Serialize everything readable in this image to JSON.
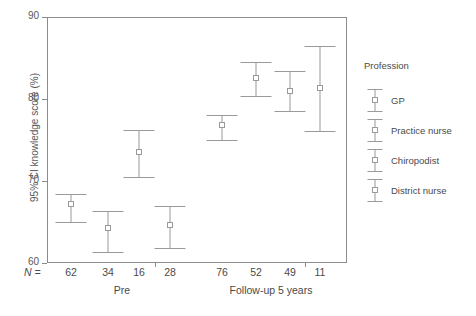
{
  "chart_data": {
    "type": "scatter",
    "title": "",
    "xlabel": "",
    "ylabel": "95% CI knowledge score (%)",
    "ylim": [
      60,
      90
    ],
    "yticks": [
      60,
      70,
      80,
      90
    ],
    "grid": false,
    "legend_position": "right",
    "legend_title": "Profession",
    "n_row_label": "N =",
    "groups": [
      "Pre",
      "Follow-up 5 years"
    ],
    "series": [
      "GP",
      "Practice nurse",
      "Chiropodist",
      "District nurse"
    ],
    "points": [
      {
        "group": "Pre",
        "series": "GP",
        "n": "62",
        "mean": 67.2,
        "lower": 65.0,
        "upper": 68.4
      },
      {
        "group": "Pre",
        "series": "Practice nurse",
        "n": "34",
        "mean": 64.3,
        "lower": 61.4,
        "upper": 66.3
      },
      {
        "group": "Pre",
        "series": "Chiropodist",
        "n": "16",
        "mean": 73.5,
        "lower": 70.5,
        "upper": 76.2
      },
      {
        "group": "Pre",
        "series": "District nurse",
        "n": "28",
        "mean": 64.6,
        "lower": 61.8,
        "upper": 66.9
      },
      {
        "group": "Follow-up 5 years",
        "series": "GP",
        "n": "76",
        "mean": 76.8,
        "lower": 75.0,
        "upper": 78.0
      },
      {
        "group": "Follow-up 5 years",
        "series": "Practice nurse",
        "n": "52",
        "mean": 82.6,
        "lower": 80.4,
        "upper": 84.5
      },
      {
        "group": "Follow-up 5 years",
        "series": "Chiropodist",
        "n": "49",
        "mean": 81.0,
        "lower": 78.5,
        "upper": 83.4
      },
      {
        "group": "Follow-up 5 years",
        "series": "District nurse",
        "n": "11",
        "mean": 81.4,
        "lower": 76.1,
        "upper": 86.5
      }
    ],
    "colors": {
      "axis": "#8c8c8c",
      "marker": "#9a9a9a",
      "text": "#4a4a4a",
      "background": "#ffffff"
    }
  }
}
